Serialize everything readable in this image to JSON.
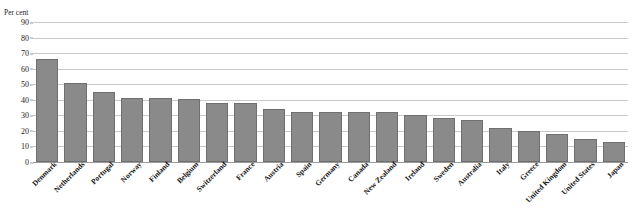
{
  "chart_data": {
    "type": "bar",
    "title": "",
    "xlabel": "",
    "ylabel": "Per cent",
    "unit_label": "Per cent",
    "ylim": [
      0,
      90
    ],
    "ytick_step": 10,
    "yticks": [
      90,
      80,
      70,
      60,
      50,
      40,
      30,
      20,
      10,
      0
    ],
    "grid": true,
    "legend": "none",
    "bar_color": "#8a8a8a",
    "bar_border_color": "#6f6f6f",
    "gridline_color": "#c9c9c9",
    "axis_color": "#9a9a9a",
    "categories": [
      "Denmark",
      "Netherlands",
      "Portugal",
      "Norway",
      "Finland",
      "Belgium",
      "Switzerland",
      "France",
      "Austria",
      "Spain",
      "Germany",
      "Canada",
      "New Zealand",
      "Ireland",
      "Sweden",
      "Australia",
      "Italy",
      "Greece",
      "United Kingdom",
      "United States",
      "Japan"
    ],
    "values": [
      66,
      51,
      45,
      41,
      41,
      40.5,
      38,
      38,
      34,
      32,
      32,
      32,
      32,
      30,
      28,
      27,
      22,
      20,
      18,
      15,
      13
    ]
  }
}
